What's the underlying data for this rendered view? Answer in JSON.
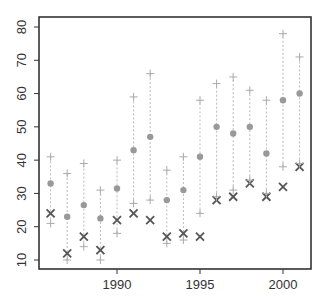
{
  "chart_data": {
    "type": "scatter",
    "title": "",
    "xlabel": "",
    "ylabel": "",
    "xlim": [
      1985.3,
      2001.7
    ],
    "ylim": [
      7.3,
      82.8
    ],
    "grid": false,
    "legend": null,
    "x_ticks": [
      1990,
      1995,
      2000
    ],
    "x_tick_labels": [
      "1990",
      "1995",
      "2000"
    ],
    "y_ticks": [
      10,
      20,
      30,
      40,
      50,
      60,
      70,
      80
    ],
    "y_tick_labels": [
      "10",
      "20",
      "30",
      "40",
      "50",
      "60",
      "70",
      "80"
    ],
    "x": [
      1986,
      1987,
      1988,
      1989,
      1990,
      1991,
      1992,
      1993,
      1994,
      1995,
      1996,
      1997,
      1998,
      1999,
      2000,
      2001
    ],
    "series": [
      {
        "name": "upper",
        "marker": "plus",
        "color": "#aaaaaa",
        "values": [
          41,
          36,
          39,
          31,
          40,
          59,
          66,
          37,
          41,
          58,
          63,
          65,
          61,
          58,
          78,
          71
        ]
      },
      {
        "name": "mean",
        "marker": "dot",
        "color": "#999999",
        "values": [
          33,
          23,
          26.5,
          22.5,
          31.5,
          43,
          47,
          28,
          31,
          41,
          50,
          48,
          50,
          42,
          58,
          60
        ]
      },
      {
        "name": "observed",
        "marker": "x",
        "color": "#555555",
        "values": [
          24,
          12,
          17,
          13,
          22,
          24,
          22,
          17,
          18,
          17,
          28,
          29,
          33,
          29,
          32,
          38
        ]
      },
      {
        "name": "lower",
        "marker": "plus",
        "color": "#aaaaaa",
        "values": [
          21,
          10,
          14,
          10,
          18,
          27,
          28,
          15,
          16,
          24,
          29,
          31,
          34,
          30,
          38,
          39
        ]
      }
    ],
    "interval_lines": {
      "style": "dotted",
      "color": "#bbbbbb",
      "from": "lower",
      "to": "upper"
    }
  }
}
